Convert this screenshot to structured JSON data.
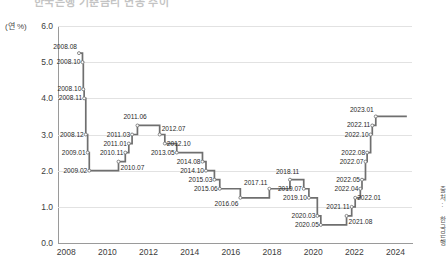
{
  "title": "한국은행 기준금리 변동 추이",
  "unit_label": "(연 %)",
  "source_note": "출처: 한국은행",
  "accent_color": "#6f6f6f",
  "grid_color": "#e2e2e2",
  "axis_color": "#9a9a9a",
  "yticks": [
    "6.0",
    "5.0",
    "4.0",
    "3.0",
    "2.0",
    "1.0",
    "0.0"
  ],
  "xticks": [
    "2008",
    "2010",
    "2012",
    "2014",
    "2016",
    "2018",
    "2020",
    "2022",
    "2024"
  ],
  "chart_data": {
    "type": "line",
    "line_style": "step-post",
    "title": "한국은행 기준금리 변동 추이",
    "xlabel": "",
    "ylabel": "(연 %)",
    "ylim": [
      0.0,
      6.0
    ],
    "xlim": [
      2007.6,
      2024.8
    ],
    "ygrid": true,
    "xgrid": false,
    "legend": "none",
    "y_unit": "percent per annum",
    "series": [
      {
        "name": "한국은행 기준금리",
        "points": [
          {
            "label": "2008.08",
            "x": 2008.62,
            "y": 5.25
          },
          {
            "label": "2008.10",
            "x": 2008.79,
            "y": 5.0
          },
          {
            "label": "2008.10",
            "x": 2008.83,
            "y": 4.25
          },
          {
            "label": "2008.11",
            "x": 2008.87,
            "y": 4.0
          },
          {
            "label": "2008.12",
            "x": 2008.95,
            "y": 3.0
          },
          {
            "label": "2009.01",
            "x": 2009.04,
            "y": 2.5
          },
          {
            "label": "2009.02",
            "x": 2009.12,
            "y": 2.0
          },
          {
            "label": "2010.07",
            "x": 2010.54,
            "y": 2.25
          },
          {
            "label": "2010.11",
            "x": 2010.87,
            "y": 2.5
          },
          {
            "label": "2011.01",
            "x": 2011.04,
            "y": 2.75
          },
          {
            "label": "2011.03",
            "x": 2011.2,
            "y": 3.0
          },
          {
            "label": "2011.06",
            "x": 2011.46,
            "y": 3.25
          },
          {
            "label": "2012.07",
            "x": 2012.54,
            "y": 3.0
          },
          {
            "label": "2012.10",
            "x": 2012.79,
            "y": 2.75
          },
          {
            "label": "2013.05",
            "x": 2013.37,
            "y": 2.5
          },
          {
            "label": "2014.08",
            "x": 2014.62,
            "y": 2.25
          },
          {
            "label": "2014.10",
            "x": 2014.79,
            "y": 2.0
          },
          {
            "label": "2015.03",
            "x": 2015.2,
            "y": 1.75
          },
          {
            "label": "2015.06",
            "x": 2015.46,
            "y": 1.5
          },
          {
            "label": "2016.06",
            "x": 2016.46,
            "y": 1.25
          },
          {
            "label": "2017.11",
            "x": 2017.87,
            "y": 1.5
          },
          {
            "label": "2018.11",
            "x": 2018.87,
            "y": 1.75
          },
          {
            "label": "2019.07",
            "x": 2019.54,
            "y": 1.5
          },
          {
            "label": "2019.10",
            "x": 2019.79,
            "y": 1.25
          },
          {
            "label": "2020.03",
            "x": 2020.2,
            "y": 0.75
          },
          {
            "label": "2020.05",
            "x": 2020.37,
            "y": 0.5
          },
          {
            "label": "2021.08",
            "x": 2021.62,
            "y": 0.75
          },
          {
            "label": "2021.11",
            "x": 2021.87,
            "y": 1.0
          },
          {
            "label": "2022.01",
            "x": 2022.04,
            "y": 1.25
          },
          {
            "label": "2022.04",
            "x": 2022.29,
            "y": 1.5
          },
          {
            "label": "2022.05",
            "x": 2022.37,
            "y": 1.75
          },
          {
            "label": "2022.07",
            "x": 2022.54,
            "y": 2.25
          },
          {
            "label": "2022.08",
            "x": 2022.62,
            "y": 2.5
          },
          {
            "label": "2022.10",
            "x": 2022.79,
            "y": 3.0
          },
          {
            "label": "2022.11",
            "x": 2022.87,
            "y": 3.25
          },
          {
            "label": "2023.01",
            "x": 2023.04,
            "y": 3.5
          },
          {
            "label": "",
            "x": 2024.55,
            "y": 3.5
          }
        ]
      }
    ],
    "callouts": [
      {
        "text": "2008.08",
        "x": 2008.62,
        "y": 5.25,
        "anchor": "left-above"
      },
      {
        "text": "2008.10",
        "x": 2008.79,
        "y": 5.0,
        "anchor": "left"
      },
      {
        "text": "2008.10",
        "x": 2008.83,
        "y": 4.25,
        "anchor": "left"
      },
      {
        "text": "2008.11",
        "x": 2008.87,
        "y": 4.0,
        "anchor": "left"
      },
      {
        "text": "2008.12",
        "x": 2008.95,
        "y": 3.0,
        "anchor": "left"
      },
      {
        "text": "2009.01",
        "x": 2009.04,
        "y": 2.5,
        "anchor": "left"
      },
      {
        "text": "2009.02",
        "x": 2009.12,
        "y": 2.0,
        "anchor": "left"
      },
      {
        "text": "2010.07",
        "x": 2010.54,
        "y": 2.25,
        "anchor": "right-below"
      },
      {
        "text": "2010.11",
        "x": 2010.87,
        "y": 2.5,
        "anchor": "left"
      },
      {
        "text": "2011.01",
        "x": 2011.04,
        "y": 2.75,
        "anchor": "left"
      },
      {
        "text": "2011.03",
        "x": 2011.2,
        "y": 3.0,
        "anchor": "left"
      },
      {
        "text": "2011.06",
        "x": 2011.46,
        "y": 3.25,
        "anchor": "above"
      },
      {
        "text": "2012.07",
        "x": 2012.54,
        "y": 3.0,
        "anchor": "right-above"
      },
      {
        "text": "2012.10",
        "x": 2012.79,
        "y": 2.75,
        "anchor": "right"
      },
      {
        "text": "2013.05",
        "x": 2013.37,
        "y": 2.5,
        "anchor": "left"
      },
      {
        "text": "2014.08",
        "x": 2014.62,
        "y": 2.25,
        "anchor": "left"
      },
      {
        "text": "2014.10",
        "x": 2014.79,
        "y": 2.0,
        "anchor": "left"
      },
      {
        "text": "2015.03",
        "x": 2015.2,
        "y": 1.75,
        "anchor": "left"
      },
      {
        "text": "2015.06",
        "x": 2015.46,
        "y": 1.5,
        "anchor": "left"
      },
      {
        "text": "2016.06",
        "x": 2016.46,
        "y": 1.25,
        "anchor": "left-below"
      },
      {
        "text": "2017.11",
        "x": 2017.87,
        "y": 1.5,
        "anchor": "left-above"
      },
      {
        "text": "2018.11",
        "x": 2018.87,
        "y": 1.75,
        "anchor": "above"
      },
      {
        "text": "2019.07",
        "x": 2019.54,
        "y": 1.5,
        "anchor": "left"
      },
      {
        "text": "2019.10",
        "x": 2019.79,
        "y": 1.25,
        "anchor": "left"
      },
      {
        "text": "2020.03",
        "x": 2020.2,
        "y": 0.75,
        "anchor": "left"
      },
      {
        "text": "2020.05",
        "x": 2020.37,
        "y": 0.5,
        "anchor": "left"
      },
      {
        "text": "2021.08",
        "x": 2021.62,
        "y": 0.75,
        "anchor": "right-below"
      },
      {
        "text": "2021.11",
        "x": 2021.87,
        "y": 1.0,
        "anchor": "left"
      },
      {
        "text": "2022.01",
        "x": 2022.04,
        "y": 1.25,
        "anchor": "right"
      },
      {
        "text": "2022.04",
        "x": 2022.29,
        "y": 1.5,
        "anchor": "left"
      },
      {
        "text": "2022.05",
        "x": 2022.37,
        "y": 1.75,
        "anchor": "left"
      },
      {
        "text": "2022.07",
        "x": 2022.54,
        "y": 2.25,
        "anchor": "left"
      },
      {
        "text": "2022.08",
        "x": 2022.62,
        "y": 2.5,
        "anchor": "left"
      },
      {
        "text": "2022.10",
        "x": 2022.79,
        "y": 3.0,
        "anchor": "left"
      },
      {
        "text": "2022.11",
        "x": 2022.87,
        "y": 3.25,
        "anchor": "left"
      },
      {
        "text": "2023.01",
        "x": 2023.04,
        "y": 3.5,
        "anchor": "left-above"
      }
    ]
  }
}
